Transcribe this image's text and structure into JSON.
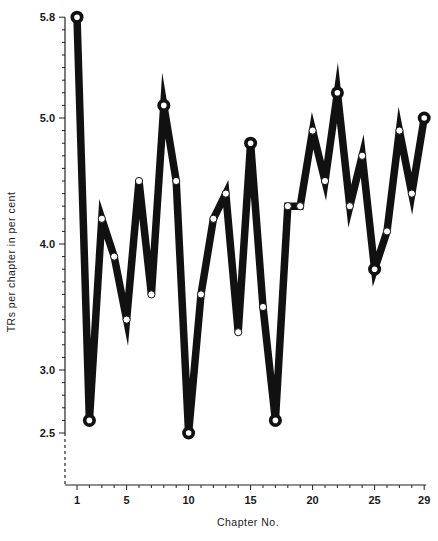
{
  "chart_data": {
    "type": "line",
    "title": "",
    "xlabel": "Chapter No.",
    "ylabel": "TRs per chapter in per cent",
    "x": [
      1,
      2,
      3,
      4,
      5,
      6,
      7,
      8,
      9,
      10,
      11,
      12,
      13,
      14,
      15,
      16,
      17,
      18,
      19,
      20,
      21,
      22,
      23,
      24,
      25,
      26,
      27,
      28,
      29
    ],
    "values": [
      5.8,
      2.6,
      4.2,
      3.9,
      3.4,
      4.5,
      3.6,
      5.1,
      4.5,
      2.5,
      3.6,
      4.2,
      4.4,
      3.3,
      4.8,
      3.5,
      2.6,
      4.3,
      4.3,
      4.9,
      4.5,
      5.2,
      4.3,
      4.7,
      3.8,
      4.1,
      4.9,
      4.4,
      5.0
    ],
    "highlighted_extremes": [
      1,
      2,
      8,
      10,
      15,
      17,
      22,
      25,
      29
    ],
    "x_ticks": [
      1,
      5,
      10,
      15,
      20,
      25,
      29
    ],
    "x_tick_labels": [
      "1",
      "5",
      "10",
      "15",
      "20",
      "25",
      "29"
    ],
    "y_ticks": [
      2.5,
      3.0,
      4.0,
      5.0,
      5.8
    ],
    "y_tick_labels": [
      "2.5",
      "3.0",
      "4.0",
      "5.0",
      "5.8"
    ],
    "ylim": [
      2.1,
      5.8
    ],
    "xlim": [
      1,
      29
    ],
    "grid": false,
    "legend": null
  },
  "colors": {
    "line": "#111111",
    "marker_fill": "#ffffff",
    "axis": "#222222"
  }
}
